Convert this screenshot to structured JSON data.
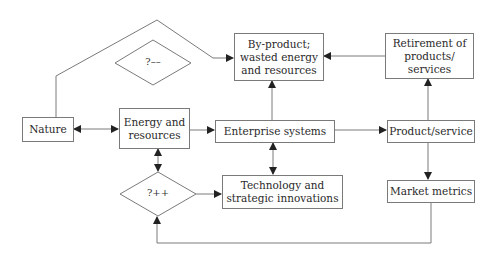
{
  "diagram": {
    "nodes": {
      "nature": "Nature",
      "energy": "Energy and\nresources",
      "enterprise": "Enterprise systems",
      "product": "Product/service",
      "retirement": "Retirement of\nproducts/\nservices",
      "byproduct": "By-product;\nwasted energy\nand resources",
      "technology": "Technology and\nstrategic innovations",
      "market": "Market metrics"
    },
    "decisions": {
      "minus": "?––",
      "plus": "?++"
    },
    "edges": [
      {
        "from": "nature",
        "to": "energy",
        "type": "bidirectional"
      },
      {
        "from": "energy",
        "to": "enterprise",
        "type": "directed"
      },
      {
        "from": "enterprise",
        "to": "product",
        "type": "directed"
      },
      {
        "from": "enterprise",
        "to": "byproduct",
        "type": "directed"
      },
      {
        "from": "product",
        "to": "retirement",
        "type": "directed"
      },
      {
        "from": "retirement",
        "to": "byproduct",
        "type": "directed"
      },
      {
        "from": "product",
        "to": "market",
        "type": "directed"
      },
      {
        "from": "energy",
        "to": "plus_decision",
        "type": "bidirectional"
      },
      {
        "from": "plus_decision",
        "to": "technology",
        "type": "directed"
      },
      {
        "from": "enterprise",
        "to": "technology",
        "type": "bidirectional"
      },
      {
        "from": "market",
        "to": "plus_decision",
        "type": "directed"
      },
      {
        "from": "nature",
        "to": "byproduct",
        "type": "directed",
        "via": "top loop"
      }
    ]
  }
}
